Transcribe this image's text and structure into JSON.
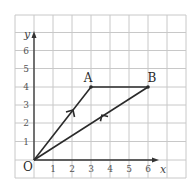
{
  "diagram": {
    "type": "coordinate-grid-triangle",
    "axes": {
      "x_label": "x",
      "y_label": "y",
      "origin_label": "O",
      "x_ticks": [
        "1",
        "2",
        "3",
        "4",
        "5",
        "6"
      ],
      "y_ticks": [
        "1",
        "2",
        "3",
        "4",
        "5",
        "6"
      ]
    },
    "points": [
      {
        "label": "O",
        "x": 0,
        "y": 0
      },
      {
        "label": "A",
        "x": 3,
        "y": 4
      },
      {
        "label": "B",
        "x": 6,
        "y": 4
      }
    ],
    "segments": [
      {
        "from": "O",
        "to": "A",
        "arrow": true
      },
      {
        "from": "A",
        "to": "B",
        "arrow": false
      },
      {
        "from": "O",
        "to": "B",
        "arrow": true
      }
    ],
    "colors": {
      "grid": "#c8c8c8",
      "lines": "#2a2a2a",
      "background": "#ffffff"
    }
  }
}
